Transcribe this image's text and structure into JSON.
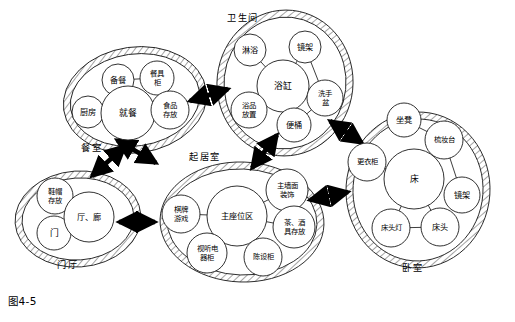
{
  "figure": {
    "caption": "图4-5"
  },
  "zones": [
    {
      "id": "dining",
      "label": "餐室",
      "label_x": 92,
      "label_y": 148,
      "cx": 135,
      "cy": 100,
      "rx": 72,
      "ry": 53,
      "rotate": -8,
      "nodes": [
        {
          "id": "prep",
          "label": "备餐",
          "lines": [
            "备餐"
          ],
          "cx": 118,
          "cy": 80,
          "r": 16,
          "size": "s1"
        },
        {
          "id": "tableware",
          "label": "餐具柜",
          "lines": [
            "餐具",
            "柜"
          ],
          "cx": 157,
          "cy": 78,
          "r": 17,
          "size": "s2"
        },
        {
          "id": "kitchen",
          "label": "厨房",
          "lines": [
            "厨房"
          ],
          "cx": 88,
          "cy": 112,
          "r": 16,
          "size": "s1"
        },
        {
          "id": "eating",
          "label": "就餐",
          "lines": [
            "就餐"
          ],
          "cx": 128,
          "cy": 113,
          "r": 27,
          "size": "s3"
        },
        {
          "id": "foodstore",
          "label": "食品存放",
          "lines": [
            "食品",
            "存放"
          ],
          "cx": 170,
          "cy": 110,
          "r": 19,
          "size": "s2"
        }
      ],
      "links": [
        {
          "from": "prep",
          "to": "tableware",
          "arrow": "both"
        },
        {
          "from": "prep",
          "to": "eating",
          "arrow": "to"
        },
        {
          "from": "kitchen",
          "to": "eating",
          "arrow": "to"
        },
        {
          "from": "eating",
          "to": "foodstore",
          "arrow": "to"
        }
      ]
    },
    {
      "id": "bathroom",
      "label": "卫生间",
      "label_x": 243,
      "label_y": 18,
      "cx": 285,
      "cy": 83,
      "rx": 68,
      "ry": 73,
      "rotate": 6,
      "nodes": [
        {
          "id": "shower",
          "label": "淋浴",
          "lines": [
            "淋浴"
          ],
          "cx": 250,
          "cy": 50,
          "r": 16,
          "size": "s1"
        },
        {
          "id": "mirror1",
          "label": "镜架",
          "lines": [
            "镜架"
          ],
          "cx": 305,
          "cy": 47,
          "r": 16,
          "size": "s1"
        },
        {
          "id": "bathtub",
          "label": "浴缸",
          "lines": [
            "浴缸"
          ],
          "cx": 283,
          "cy": 86,
          "r": 26,
          "size": "s3"
        },
        {
          "id": "basin",
          "label": "洗手盆",
          "lines": [
            "洗手",
            "盆"
          ],
          "cx": 325,
          "cy": 98,
          "r": 18,
          "size": "s2"
        },
        {
          "id": "bathgoods",
          "label": "浴品放置",
          "lines": [
            "浴品",
            "放置"
          ],
          "cx": 249,
          "cy": 110,
          "r": 18,
          "size": "s2"
        },
        {
          "id": "toilet",
          "label": "便桶",
          "lines": [
            "便桶"
          ],
          "cx": 294,
          "cy": 125,
          "r": 17,
          "size": "s1"
        }
      ],
      "links": [
        {
          "from": "shower",
          "to": "bathtub",
          "arrow": "to"
        },
        {
          "from": "mirror1",
          "to": "bathtub",
          "arrow": "to"
        },
        {
          "from": "mirror1",
          "to": "basin",
          "arrow": "to"
        },
        {
          "from": "bathtub",
          "to": "basin",
          "arrow": "to"
        },
        {
          "from": "bathgoods",
          "to": "bathtub",
          "arrow": "to"
        },
        {
          "from": "toilet",
          "to": "bathtub",
          "arrow": "to"
        },
        {
          "from": "toilet",
          "to": "basin",
          "arrow": "to"
        }
      ]
    },
    {
      "id": "living",
      "label": "起居室",
      "label_x": 205,
      "label_y": 157,
      "cx": 242,
      "cy": 222,
      "rx": 82,
      "ry": 60,
      "rotate": 2,
      "nodes": [
        {
          "id": "games",
          "label": "棋牌游戏",
          "lines": [
            "棋牌",
            "游戏"
          ],
          "cx": 181,
          "cy": 214,
          "r": 19,
          "size": "s2"
        },
        {
          "id": "seating",
          "label": "主座位区",
          "lines": [
            "主座位区"
          ],
          "cx": 237,
          "cy": 216,
          "r": 30,
          "size": "s1"
        },
        {
          "id": "walldec",
          "label": "主墙面装饰",
          "lines": [
            "主墙面",
            "装饰"
          ],
          "cx": 287,
          "cy": 190,
          "r": 21,
          "size": "s2"
        },
        {
          "id": "teawine",
          "label": "茶、酒具存放",
          "lines": [
            "茶、酒",
            "具存放"
          ],
          "cx": 294,
          "cy": 227,
          "r": 21,
          "size": "s2"
        },
        {
          "id": "avcab",
          "label": "视听电器柜",
          "lines": [
            "视听电",
            "器柜"
          ],
          "cx": 207,
          "cy": 253,
          "r": 20,
          "size": "s2"
        },
        {
          "id": "display",
          "label": "陈设柜",
          "lines": [
            "陈设柜"
          ],
          "cx": 263,
          "cy": 257,
          "r": 19,
          "size": "s2"
        }
      ],
      "links": [
        {
          "from": "games",
          "to": "seating",
          "arrow": "to"
        },
        {
          "from": "walldec",
          "to": "seating",
          "arrow": "to"
        },
        {
          "from": "teawine",
          "to": "seating",
          "arrow": "to"
        },
        {
          "from": "avcab",
          "to": "seating",
          "arrow": "to"
        },
        {
          "from": "display",
          "to": "seating",
          "arrow": "to"
        }
      ]
    },
    {
      "id": "entry",
      "label": "门厅",
      "label_x": 68,
      "label_y": 265,
      "cx": 78,
      "cy": 219,
      "rx": 63,
      "ry": 48,
      "rotate": -4,
      "nodes": [
        {
          "id": "shoehat",
          "label": "鞋帽存放",
          "lines": [
            "鞋帽",
            "存放"
          ],
          "cx": 55,
          "cy": 196,
          "r": 18,
          "size": "s2"
        },
        {
          "id": "door",
          "label": "门",
          "lines": [
            "门"
          ],
          "cx": 54,
          "cy": 233,
          "r": 17,
          "size": "s3"
        },
        {
          "id": "hall",
          "label": "厅、廊",
          "lines": [
            "厅、廊"
          ],
          "cx": 89,
          "cy": 217,
          "r": 25,
          "size": "s1"
        }
      ],
      "links": [
        {
          "from": "shoehat",
          "to": "hall",
          "arrow": "to"
        },
        {
          "from": "door",
          "to": "hall",
          "arrow": "to"
        }
      ]
    },
    {
      "id": "bedroom",
      "label": "卧室",
      "label_x": 413,
      "label_y": 268,
      "cx": 418,
      "cy": 190,
      "rx": 72,
      "ry": 78,
      "rotate": 4,
      "nodes": [
        {
          "id": "stool",
          "label": "坐凳",
          "lines": [
            "坐凳"
          ],
          "cx": 404,
          "cy": 120,
          "r": 17,
          "size": "s1"
        },
        {
          "id": "dresser",
          "label": "梳妆台",
          "lines": [
            "梳妆台"
          ],
          "cx": 444,
          "cy": 140,
          "r": 19,
          "size": "s2"
        },
        {
          "id": "wardrobe",
          "label": "更衣柜",
          "lines": [
            "更衣柜"
          ],
          "cx": 367,
          "cy": 162,
          "r": 19,
          "size": "s2"
        },
        {
          "id": "bed",
          "label": "床",
          "lines": [
            "床"
          ],
          "cx": 414,
          "cy": 179,
          "r": 30,
          "size": "s3"
        },
        {
          "id": "mirror2",
          "label": "镜架",
          "lines": [
            "镜架"
          ],
          "cx": 462,
          "cy": 195,
          "r": 18,
          "size": "s1"
        },
        {
          "id": "bedlamp",
          "label": "床头灯",
          "lines": [
            "床头灯"
          ],
          "cx": 391,
          "cy": 228,
          "r": 19,
          "size": "s2"
        },
        {
          "id": "bedhead",
          "label": "床头",
          "lines": [
            "床头"
          ],
          "cx": 440,
          "cy": 227,
          "r": 19,
          "size": "s1"
        }
      ],
      "links": [
        {
          "from": "stool",
          "to": "dresser",
          "arrow": "to"
        },
        {
          "from": "dresser",
          "to": "bed",
          "arrow": "to"
        },
        {
          "from": "dresser",
          "to": "mirror2",
          "arrow": "to"
        },
        {
          "from": "wardrobe",
          "to": "bed",
          "arrow": "to"
        },
        {
          "from": "bed",
          "to": "bedlamp",
          "arrow": "to"
        },
        {
          "from": "bed",
          "to": "bedhead",
          "arrow": "to"
        },
        {
          "from": "bedlamp",
          "to": "bedhead",
          "arrow": "both"
        }
      ]
    }
  ],
  "zone_links": [
    {
      "id": "dining-bathroom",
      "from": "dining",
      "to": "bathroom",
      "x1": 190,
      "y1": 101,
      "x2": 228,
      "y2": 89
    },
    {
      "id": "dining-living",
      "from": "dining",
      "to": "living",
      "x1": 156,
      "y1": 163,
      "x2": 117,
      "y2": 140
    },
    {
      "id": "bathroom-living",
      "from": "bathroom",
      "to": "living",
      "x1": 277,
      "y1": 135,
      "x2": 252,
      "y2": 168
    },
    {
      "id": "bathroom-bedroom",
      "from": "bathroom",
      "to": "bedroom",
      "x1": 330,
      "y1": 121,
      "x2": 362,
      "y2": 143
    },
    {
      "id": "living-bedroom",
      "from": "living",
      "to": "bedroom",
      "x1": 310,
      "y1": 200,
      "x2": 348,
      "y2": 192
    },
    {
      "id": "entry-living",
      "from": "entry",
      "to": "living",
      "x1": 119,
      "y1": 222,
      "x2": 155,
      "y2": 222
    },
    {
      "id": "entry-dining",
      "from": "entry",
      "to": "dining",
      "x1": 92,
      "y1": 176,
      "x2": 125,
      "y2": 146
    }
  ],
  "colors": {
    "stroke": "#1a1a1a",
    "background": "#ffffff",
    "arrow": "#000000"
  }
}
